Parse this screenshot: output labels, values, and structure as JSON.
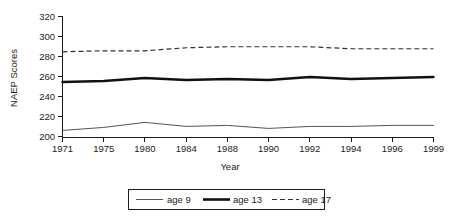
{
  "chart_data": {
    "type": "line",
    "title": "",
    "xlabel": "Year",
    "ylabel": "NAEP Scores",
    "categories": [
      "1971",
      "1975",
      "1980",
      "1984",
      "1988",
      "1990",
      "1992",
      "1994",
      "1996",
      "1999"
    ],
    "x_tick_labels": [
      "1971",
      "1975",
      "1980",
      "1984",
      "1988",
      "1990",
      "1992",
      "1994",
      "1996",
      "1999"
    ],
    "y_tick_labels": [
      "200",
      "220",
      "240",
      "260",
      "280",
      "300",
      "320"
    ],
    "y_ticks": [
      200,
      220,
      240,
      260,
      280,
      300,
      320
    ],
    "ylim": [
      195,
      320
    ],
    "grid": false,
    "legend_position": "bottom-outside",
    "series": [
      {
        "name": "age 9",
        "style": "thin-solid",
        "color": "#555555",
        "values": [
          207,
          210,
          215,
          211,
          212,
          209,
          211,
          211,
          212,
          212
        ]
      },
      {
        "name": "age 13",
        "style": "thick-solid",
        "color": "#111111",
        "values": [
          255,
          256,
          259,
          257,
          258,
          257,
          260,
          258,
          259,
          260
        ]
      },
      {
        "name": "age 17",
        "style": "dashed",
        "color": "#333333",
        "values": [
          285,
          286,
          286,
          289,
          290,
          290,
          290,
          288,
          288,
          288
        ]
      }
    ],
    "legend_entries": [
      {
        "label": "age 9",
        "style": "thin-solid",
        "color": "#555555"
      },
      {
        "label": "age 13",
        "style": "thick-solid",
        "color": "#111111"
      },
      {
        "label": "age 17",
        "style": "dashed",
        "color": "#333333"
      }
    ]
  }
}
